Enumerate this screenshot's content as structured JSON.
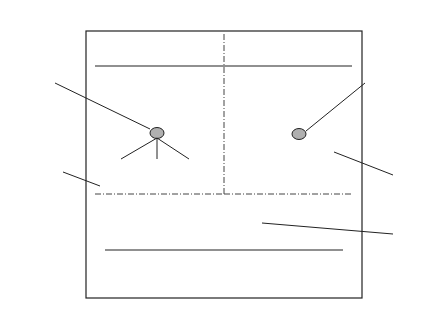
{
  "diagram": {
    "planes": {
      "control": "Control plane",
      "user": "User plane"
    },
    "layers": {
      "higher": "Higher layers",
      "convergence": "Covergence layers",
      "dlc": "DLC",
      "phy": "PHY"
    },
    "saps": {
      "control": "Control SAP",
      "user": "User SAP(s)"
    },
    "blocks": {
      "rrc": "RRC",
      "acf": "ACF",
      "dcc": "DCC",
      "rlc": "RLC",
      "ec": "EC",
      "mac": "MAC",
      "phy": "PHY"
    },
    "annotations": {
      "mac_id_1": "Identified by",
      "mac_id_2": "MAC_ID",
      "conn_id_1": "Identified by",
      "conn_id_2": "CONN_ID",
      "ap_id_1": "Identified by",
      "ap_id_2": "AP_ID"
    },
    "colors": {
      "line": "#222222",
      "sap_fill": "#b0b0b0"
    }
  }
}
